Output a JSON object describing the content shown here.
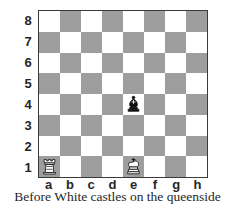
{
  "diagram": {
    "type": "chessboard",
    "caption": "Before White castles on the queenside",
    "orientation": "white",
    "board_size": 8,
    "colors": {
      "light_square": "#ffffff",
      "dark_square": "#9e9e9e",
      "border": "#3a3a3a",
      "label_text": "#262626",
      "caption_text": "#1f1f1f",
      "white_piece_fill": "#ffffff",
      "white_piece_stroke": "#1a1a1a",
      "black_piece_fill": "#111111"
    },
    "rank_labels": [
      "8",
      "7",
      "6",
      "5",
      "4",
      "3",
      "2",
      "1"
    ],
    "file_labels": [
      "a",
      "b",
      "c",
      "d",
      "e",
      "f",
      "g",
      "h"
    ],
    "pieces": [
      {
        "square": "a1",
        "color": "white",
        "piece": "rook",
        "icon": "white-rook-icon"
      },
      {
        "square": "e1",
        "color": "white",
        "piece": "king",
        "icon": "white-king-icon"
      },
      {
        "square": "e4",
        "color": "black",
        "piece": "bishop",
        "icon": "black-bishop-icon"
      }
    ]
  }
}
